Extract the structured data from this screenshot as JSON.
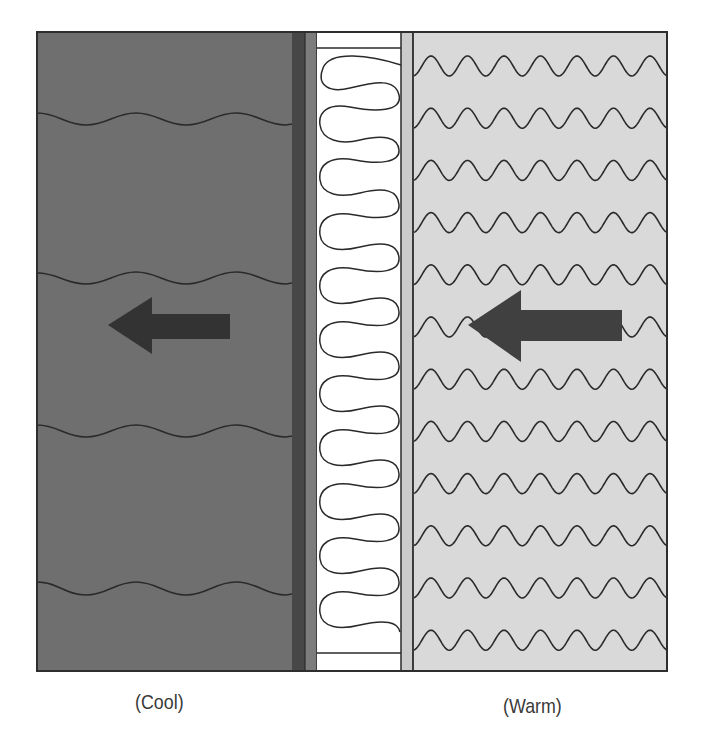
{
  "diagram": {
    "labels": {
      "cool": "(Cool)",
      "warm": "(Warm)"
    },
    "zones": [
      {
        "id": "cool-side",
        "label": "(Cool)",
        "fill": "#6f6f6f",
        "wave_rows": 4,
        "pattern": "gentle-wave"
      },
      {
        "id": "sheathing-dark",
        "fill": "#474747"
      },
      {
        "id": "sheathing-medium",
        "fill": "#7c7c7c"
      },
      {
        "id": "insulation",
        "fill": "#ffffff",
        "pattern": "batt-insulation-loops"
      },
      {
        "id": "vapor-strip",
        "fill": "#cbcbcb"
      },
      {
        "id": "warm-side",
        "label": "(Warm)",
        "fill": "#d9d9d9",
        "wave_rows": 12,
        "pattern": "tight-wave"
      }
    ],
    "arrows": [
      {
        "id": "cool-side-arrow",
        "direction": "left",
        "color": "#333333"
      },
      {
        "id": "warm-side-arrow",
        "direction": "left",
        "color": "#404040"
      }
    ],
    "colors": {
      "frame": "#2e2e2e",
      "line": "#2a2a2a"
    }
  }
}
